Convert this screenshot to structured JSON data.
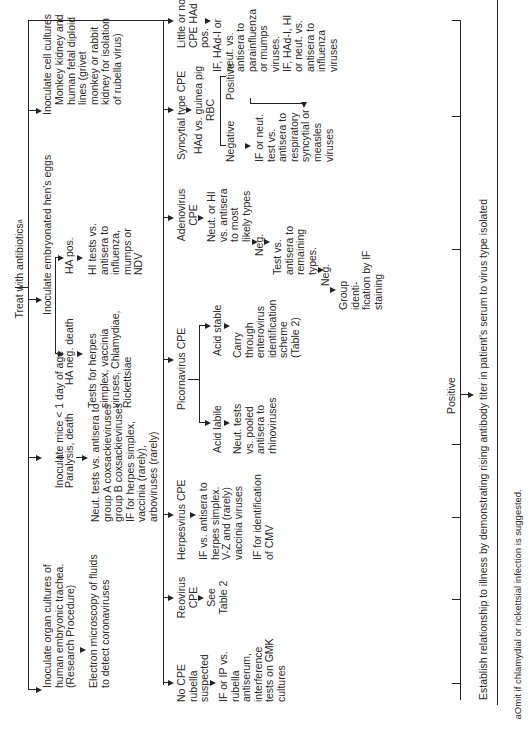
{
  "title": "Treat with antibiotics",
  "title_sup": "a",
  "level1": {
    "cell_cultures": {
      "label": "Inoculate cell cultures",
      "detail": "Monkey kidney and\nhuman fetal diploid\nlines (grivet\nmonkey or rabbit\nkidney for isolation\nof rubella virus)"
    },
    "eggs": {
      "label": "Inoculate embryonated hen's eggs",
      "ha_pos": "HA pos.",
      "ha_pos_result": "HI tests vs.\nantisera to\ninfluenza,\nmumps or\nNDV",
      "ha_neg": "HA neg. death",
      "ha_neg_result": "Tests for herpes\nsimplex, vaccinia\nviruses, Chlamydiae,\nRickettsiae"
    },
    "mice": {
      "label": "Inoculate mice < 1 day of age",
      "paralysis": "Paralysis, death",
      "result": "Neut. tests vs. antisera to\ngroup A coxsackieviruses\ngroup B coxsackieviruses\nIF for herpes simplex,\nvaccinia (rarely),\narboviruses (rarely)"
    },
    "organ_cultures": {
      "label": "Inoculate organ cultures of\nhuman embryonic trachea.\n(Research Procedure)",
      "result": "Electron microscopy of fluids\nto detect coronaviruses"
    }
  },
  "level2": {
    "little_cpe": {
      "label": "Little or no\nCPE HAd\npos.",
      "result": "IF, HAd-I or\nneut. vs.\nantisera to\nparainfluenza\nor mumps\nviruses.\nIF, HAd-I, HI\nor neut. vs.\nantisera to\ninfluenza\nviruses"
    },
    "syncytial": {
      "label": "Syncytial type CPE",
      "had": "HAd vs. guinea pig\nRBC",
      "positive": "Positive",
      "negative": "Negative",
      "negative_result": "IF or neut.\ntest vs.\nantisera to\nrespiratory\nsyncytial or\nmeasles\nviruses"
    },
    "adenovirus": {
      "label": "Adenovirus\nCPE",
      "step1": "Neut. or HI\nvs. antisera\nto most\nlikely types",
      "neg1": "Neg.",
      "step2": "Test vs.\nantisera to\nremaining\ntypes.",
      "neg2": "Neg.",
      "step3": "Group\nidenti-\nfication by IF\nstaining"
    },
    "picornavirus": {
      "label": "Picornavirus CPE",
      "acid_stable": "Acid stable",
      "acid_stable_result": "Carry\nthrough\nenterovirus\nidentification\nscheme\n(Table 2)",
      "acid_labile": "Acid labile",
      "acid_labile_result": "Neut. tests\nvs. pooled\nantisera to\nrhinoviruses"
    },
    "herpesvirus": {
      "label": "Herpesvirus CPE",
      "result1": "IF vs. antisera to\nherpes simplex.\nV-Z and (rarely)\nvaccinia viruses",
      "result2": "IF for identification\nof CMV"
    },
    "reovirus": {
      "label": "Reovirus\nCPE",
      "result": "See\nTable 2"
    },
    "no_cpe": {
      "label": "No CPE\nrubella\nsuspected",
      "result": "IF or IP vs.\nrubella\nantiserum,\ninterference\ntests on GMK\ncultures"
    }
  },
  "bottom": {
    "positive_label": "Positive",
    "establish": "Establish relationship to illness by demonstrating rising antibody titer in patient's serum to virus type isolated",
    "footnote": "aOmit if chlamydial or rickettsial infection is suggested."
  }
}
